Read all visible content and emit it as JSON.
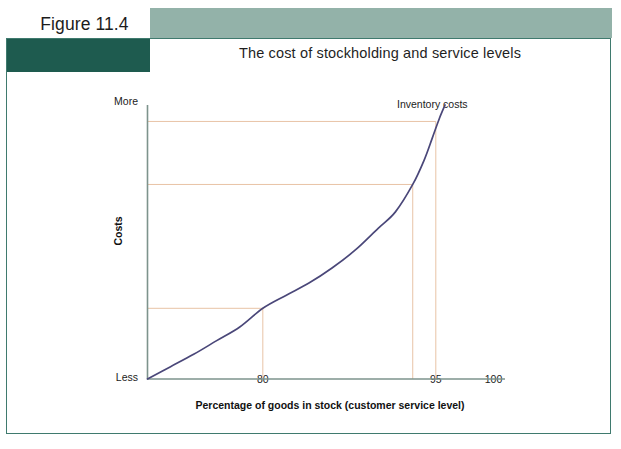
{
  "figure": {
    "number_label": "Figure 11.4",
    "title": "The cost of stockholding and service levels"
  },
  "colors": {
    "sage_bar": "#93b2a9",
    "dark_block": "#1e5b4f",
    "panel_border": "#3f7a6e",
    "axis": "#7d938c",
    "curve": "#4a4779",
    "guide_line": "#e8c3a6",
    "text": "#1c1c1c"
  },
  "chart_data": {
    "type": "line",
    "title": "The cost of stockholding and service levels",
    "xlabel": "Percentage of goods in stock (customer service level)",
    "ylabel": "Costs",
    "y_axis_top_label": "More",
    "y_axis_bottom_label": "Less",
    "xlim": [
      70,
      101
    ],
    "ylim": [
      0,
      100
    ],
    "grid": false,
    "legend_position": "inline-right",
    "series": [
      {
        "name": "Inventory costs",
        "color": "#4a4779",
        "x": [
          70.0,
          72.0,
          74.0,
          76.0,
          78.0,
          80.0,
          82.0,
          84.0,
          86.0,
          88.0,
          90.0,
          91.5,
          93.0,
          94.0,
          94.7,
          95.3,
          95.8
        ],
        "y": [
          0.0,
          4.5,
          9.0,
          14.0,
          19.0,
          25.8,
          30.5,
          35.0,
          40.5,
          47.0,
          55.0,
          61.0,
          71.0,
          80.0,
          88.0,
          95.0,
          100.0
        ]
      }
    ],
    "x_ticks": [
      {
        "value": 80,
        "label": "80"
      },
      {
        "value": 93,
        "label": ""
      },
      {
        "value": 95,
        "label": "95"
      },
      {
        "value": 100,
        "label": "100"
      }
    ],
    "annotations": [
      {
        "text": "Inventory costs",
        "x": 88.5,
        "y": 104,
        "name": "inventory-costs-label"
      }
    ],
    "guide_lines": [
      {
        "name": "guide-80",
        "x": 80,
        "y": 25.8,
        "label": "80"
      },
      {
        "name": "guide-93",
        "x": 93,
        "y": 71.0,
        "label": ""
      },
      {
        "name": "guide-95",
        "x": 95,
        "y": 94.0,
        "label": "95"
      }
    ]
  }
}
